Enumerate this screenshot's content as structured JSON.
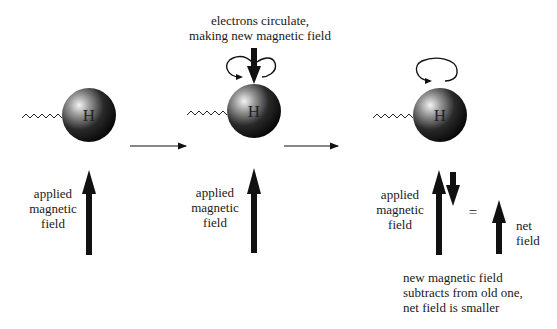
{
  "diagram": {
    "atom_label": "H",
    "panels": [
      {
        "id": "panel-1",
        "field_label": [
          "applied",
          "magnetic",
          "field"
        ]
      },
      {
        "id": "panel-2",
        "top_caption": [
          "electrons circulate,",
          "making new magnetic field"
        ],
        "field_label": [
          "applied",
          "magnetic",
          "field"
        ]
      },
      {
        "id": "panel-3",
        "field_label": [
          "applied",
          "magnetic",
          "field"
        ],
        "equals": "=",
        "net_label": [
          "net",
          "field"
        ],
        "bottom_caption": [
          "new magnetic field",
          "subtracts from old one,",
          "net field is smaller"
        ]
      }
    ],
    "colors": {
      "arrow": "#111111",
      "sphere_dark": "#0a0a0a",
      "sphere_light": "#f2f2f2",
      "background": "#ffffff"
    }
  }
}
